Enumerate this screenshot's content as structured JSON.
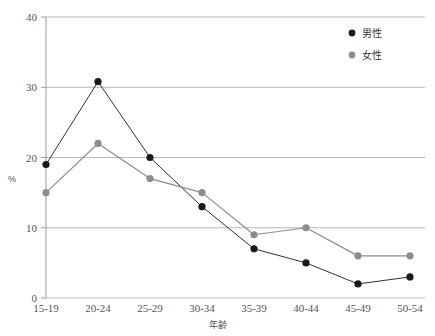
{
  "chart_data": {
    "type": "line",
    "title": "",
    "subtitle": "",
    "xlabel": "年齢",
    "ylabel": "%",
    "categories": [
      "15-19",
      "20-24",
      "25-29",
      "30-34",
      "35-39",
      "40-44",
      "45-49",
      "50-54"
    ],
    "series": [
      {
        "name": "男性",
        "color": "#1a1a1a",
        "marker": "circle",
        "values": [
          19,
          30.8,
          20,
          13,
          7,
          5,
          2,
          3
        ]
      },
      {
        "name": "女性",
        "color": "#8c8c8c",
        "marker": "circle",
        "values": [
          15,
          22,
          17,
          15,
          9,
          10,
          6,
          6
        ]
      }
    ],
    "ylim": [
      0,
      40
    ],
    "yticks": [
      0,
      10,
      20,
      30,
      40
    ],
    "ytick_labels": [
      "0",
      "10",
      "20",
      "30",
      "40"
    ],
    "grid": "horizontal",
    "legend_position": "top-right"
  },
  "legend": {
    "entries": [
      {
        "label": "男性",
        "color": "#1a1a1a"
      },
      {
        "label": "女性",
        "color": "#8c8c8c"
      }
    ]
  },
  "axes": {
    "x_title": "年齢",
    "y_title": "%"
  },
  "colors": {
    "male": "#1a1a1a",
    "female": "#8c8c8c",
    "grid": "#b8b8b8",
    "axis": "#9a9a9a",
    "background": "#ffffff"
  }
}
